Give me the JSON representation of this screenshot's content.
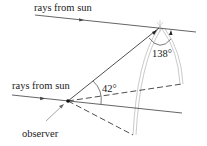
{
  "diagram": {
    "labels": {
      "top_rays": "rays from sun",
      "bottom_rays": "rays from sun",
      "observer": "observer",
      "angle_small": "42°",
      "angle_large": "138°"
    },
    "colors": {
      "line": "#222222",
      "arc": "#b8b8b8",
      "background": "#ffffff"
    }
  }
}
